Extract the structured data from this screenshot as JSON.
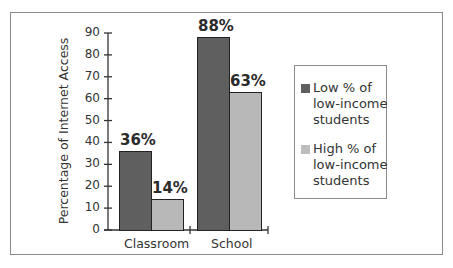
{
  "chart_data": {
    "type": "bar",
    "title": "",
    "xlabel": "",
    "ylabel": "Percentage of Internet Access",
    "ylim": [
      0,
      90
    ],
    "yticks": [
      0,
      10,
      20,
      30,
      40,
      50,
      60,
      70,
      80,
      90
    ],
    "categories": [
      "Classroom",
      "School"
    ],
    "series": [
      {
        "name": "Low % of low-income students",
        "values": [
          36,
          88
        ],
        "color": "#5f5f5f"
      },
      {
        "name": "High % of low-income students",
        "values": [
          14,
          63
        ],
        "color": "#b8b8b8"
      }
    ],
    "data_labels": [
      [
        "36%",
        "88%"
      ],
      [
        "14%",
        "63%"
      ]
    ],
    "legend_position": "right",
    "grid": false
  },
  "legend": {
    "items": [
      {
        "label": "Low % of low-income students"
      },
      {
        "label": "High % of low-income students"
      }
    ]
  }
}
